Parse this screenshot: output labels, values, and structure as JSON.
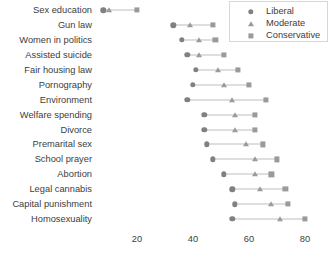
{
  "chart_data": {
    "type": "scatter",
    "title": "",
    "xlabel": "",
    "ylabel": "",
    "xlim": [
      5,
      82
    ],
    "xticks": [
      20,
      40,
      60,
      80
    ],
    "xtick_labels": [
      "20",
      "40",
      "60",
      "80"
    ],
    "grid": false,
    "legend_position": "top-right",
    "orientation": "horizontal-dotplot",
    "categories": [
      "Sex education",
      "Gun law",
      "Women in politics",
      "Assisted suicide",
      "Fair housing law",
      "Pornography",
      "Environment",
      "Welfare spending",
      "Divorce",
      "Premarital sex",
      "School prayer",
      "Abortion",
      "Legal cannabis",
      "Capital punishment",
      "Homosexuality"
    ],
    "series": [
      {
        "name": "Liberal",
        "marker": "circle",
        "color": "#808080",
        "values": [
          8,
          33,
          36,
          38,
          41,
          40,
          38,
          44,
          44,
          45,
          47,
          51,
          54,
          55,
          54
        ]
      },
      {
        "name": "Moderate",
        "marker": "triangle",
        "color": "#9a9a9a",
        "values": [
          10,
          39,
          42,
          42,
          49,
          51,
          54,
          55,
          55,
          59,
          62,
          62,
          64,
          68,
          71
        ]
      },
      {
        "name": "Conservative",
        "marker": "square",
        "color": "#9a9a9a",
        "values": [
          20,
          47,
          48,
          51,
          56,
          60,
          66,
          62,
          62,
          65,
          70,
          68,
          73,
          74,
          80
        ]
      }
    ]
  },
  "legend": {
    "entries": [
      {
        "label": "Liberal",
        "marker": "circle"
      },
      {
        "label": "Moderate",
        "marker": "triangle"
      },
      {
        "label": "Conservative",
        "marker": "square"
      }
    ]
  },
  "colors": {
    "liberal": "#808080",
    "moderate": "#9a9a9a",
    "conservative": "#9a9a9a",
    "connector": "#bdbdbd",
    "text": "#3d3d3d",
    "legend_border": "#d7d7d7",
    "background": "#ffffff"
  }
}
